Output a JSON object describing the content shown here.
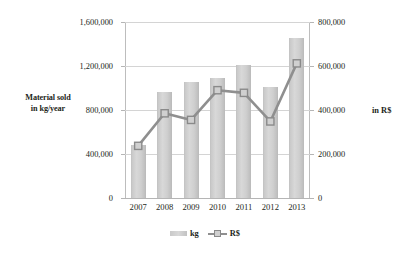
{
  "chart_data": {
    "type": "bar",
    "title": "",
    "subtitle": "",
    "categories": [
      "2007",
      "2008",
      "2009",
      "2010",
      "2011",
      "2012",
      "2013"
    ],
    "series": [
      {
        "name": "kg",
        "type": "bar",
        "axis": "left",
        "values": [
          480000,
          965000,
          1055000,
          1090000,
          1210000,
          1005000,
          1455000
        ]
      },
      {
        "name": "R$",
        "type": "line",
        "axis": "right",
        "values": [
          237000,
          385000,
          355000,
          490000,
          478000,
          348000,
          612000
        ]
      }
    ],
    "xlabel": "",
    "ylabel": "Material sold in kg/year",
    "y2label": "in R$",
    "ylim": [
      0,
      1600000
    ],
    "y2lim": [
      0,
      800000
    ],
    "yticks": [
      "0",
      "400,000",
      "800,000",
      "1,200,000",
      "1,600,000"
    ],
    "ytick_values": [
      0,
      400000,
      800000,
      1200000,
      1600000
    ],
    "y2ticks": [
      "0",
      "200,000",
      "400,000",
      "600,000",
      "800,000"
    ],
    "y2tick_values": [
      0,
      200000,
      400000,
      600000,
      800000
    ],
    "grid": true,
    "legend_position": "bottom",
    "legend": [
      "kg",
      "R$"
    ],
    "colors": {
      "bar": "#cfcfcf",
      "line": "#8f8f8f",
      "marker_fill": "#d0d0d0",
      "marker_stroke": "#8a8a8a",
      "grid": "#d4d4d4",
      "axis": "#b5b5b5",
      "text": "#231f20",
      "background": "#ffffff"
    }
  },
  "axis_titles": {
    "left_line1": "Material sold",
    "left_line2": "in kg/year",
    "right": "in R$"
  }
}
